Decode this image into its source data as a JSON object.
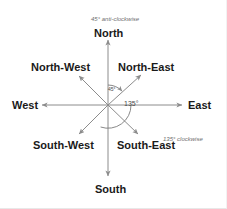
{
  "diagram": {
    "center": {
      "x": 108,
      "y": 105
    },
    "colors": {
      "arrow": "#8c8c8c",
      "label_text": "#1a1a1a",
      "note_text": "#6e6e6e",
      "angle_text": "#4a4a4a",
      "background": "#ffffff"
    },
    "directions": [
      {
        "key": "north",
        "label": "North",
        "bearing_deg": 0
      },
      {
        "key": "north_east",
        "label": "North-East",
        "bearing_deg": 45
      },
      {
        "key": "east",
        "label": "East",
        "bearing_deg": 90
      },
      {
        "key": "south_east",
        "label": "South-East",
        "bearing_deg": 135
      },
      {
        "key": "south",
        "label": "South",
        "bearing_deg": 180
      },
      {
        "key": "south_west",
        "label": "South-West",
        "bearing_deg": 225
      },
      {
        "key": "west",
        "label": "West",
        "bearing_deg": 270
      },
      {
        "key": "north_west",
        "label": "North-West",
        "bearing_deg": 315
      }
    ],
    "angle_arcs": [
      {
        "key": "arc_45",
        "label": "45°",
        "from": "North",
        "to": "North-East",
        "sweep_deg": 45
      },
      {
        "key": "arc_135",
        "label": "135°",
        "from": "East",
        "to": "South-East",
        "sweep_deg": 135
      }
    ],
    "annotations": [
      {
        "key": "anticlockwise",
        "text": "45° anti-clockwise"
      },
      {
        "key": "clockwise",
        "text": "135° clockwise"
      }
    ]
  }
}
